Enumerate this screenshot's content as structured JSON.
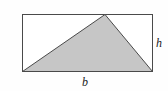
{
  "figure": {
    "background_color": "#fefefe",
    "rectangle": {
      "name": "bounding-rectangle",
      "x": 22.5,
      "y": 14.5,
      "width": 130,
      "height": 57,
      "stroke_color": "#4a4a4a",
      "stroke_width": 1,
      "fill_color": "#ffffff"
    },
    "triangle": {
      "name": "shaded-triangle",
      "points": "22.5,71.5 105,14.5 152.5,71.5",
      "fill_color": "#c6c6c6",
      "stroke_color": "#4a4a4a",
      "stroke_width": 1,
      "vertices": [
        {
          "name": "bottom-left-vertex",
          "x": 22.5,
          "y": 71.5
        },
        {
          "name": "apex-vertex",
          "x": 105,
          "y": 14.5
        },
        {
          "name": "bottom-right-vertex",
          "x": 152.5,
          "y": 71.5
        }
      ]
    },
    "labels": [
      {
        "id": "base-label",
        "text": "b",
        "x": 85,
        "y": 86,
        "anchor": "middle",
        "meaning": "base"
      },
      {
        "id": "height-label",
        "text": "h",
        "x": 159,
        "y": 47,
        "anchor": "middle",
        "meaning": "height"
      }
    ]
  }
}
